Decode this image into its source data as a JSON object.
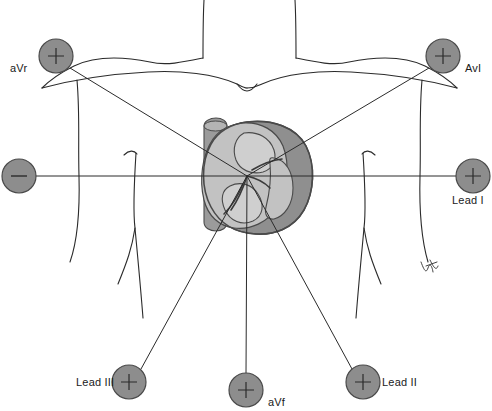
{
  "figure": {
    "background_color": "#ffffff",
    "width": 492,
    "height": 411
  },
  "colors": {
    "electrode_fill": "#8d8d8d",
    "electrode_stroke": "#4a4a4a",
    "axis_line": "#2b2b2b",
    "body_outline": "#2b2b2b",
    "heart_outline": "#4a4a4a",
    "heart_chamber_light": "#c9c9c9",
    "heart_wall_mid": "#a6a6a6",
    "heart_wall_dark": "#8f8f8f",
    "heart_vessel": "#9b9b9b",
    "label_text": "#1a1a1a"
  },
  "heart": {
    "center_x": 247,
    "center_y": 176,
    "description": "cross-sectional heart illustration, grey shaded chambers and walls"
  },
  "electrodes": [
    {
      "id": "avr",
      "label": "aVr",
      "polarity": "+",
      "cx": 56,
      "cy": 56,
      "r": 17,
      "label_x": 10,
      "label_y": 62,
      "label_side": "left"
    },
    {
      "id": "avl",
      "label": "AvI",
      "polarity": "+",
      "cx": 443,
      "cy": 56,
      "r": 17,
      "label_x": 465,
      "label_y": 62,
      "label_side": "right"
    },
    {
      "id": "lead-i-negative",
      "label": "",
      "polarity": "−",
      "cx": 19,
      "cy": 176,
      "r": 17,
      "label_x": 0,
      "label_y": 0,
      "label_side": "none"
    },
    {
      "id": "lead-i",
      "label": "Lead I",
      "polarity": "+",
      "cx": 473,
      "cy": 176,
      "r": 17,
      "label_x": 452,
      "label_y": 194,
      "label_side": "below"
    },
    {
      "id": "lead-iii",
      "label": "Lead III",
      "polarity": "+",
      "cx": 129,
      "cy": 382,
      "r": 17,
      "label_x": 76,
      "label_y": 381,
      "label_side": "left"
    },
    {
      "id": "avf",
      "label": "aVf",
      "polarity": "+",
      "cx": 246,
      "cy": 390,
      "r": 17,
      "label_x": 268,
      "label_y": 396,
      "label_side": "right"
    },
    {
      "id": "lead-ii",
      "label": "Lead II",
      "polarity": "+",
      "cx": 363,
      "cy": 382,
      "r": 17,
      "label_x": 382,
      "label_y": 381,
      "label_side": "right"
    }
  ],
  "axis_lines": [
    {
      "id": "axis-avr",
      "from": "heart-center",
      "to": "avr",
      "x1": 247,
      "y1": 176,
      "x2": 70,
      "y2": 68
    },
    {
      "id": "axis-avl",
      "from": "heart-center",
      "to": "avl",
      "x1": 247,
      "y1": 176,
      "x2": 429,
      "y2": 68
    },
    {
      "id": "axis-lead-i",
      "from": "lead-i-negative",
      "to": "lead-i",
      "x1": 36,
      "y1": 176,
      "x2": 456,
      "y2": 176
    },
    {
      "id": "axis-lead-iii",
      "from": "heart-center",
      "to": "lead-iii",
      "x1": 247,
      "y1": 176,
      "x2": 141,
      "y2": 369
    },
    {
      "id": "axis-avf",
      "from": "heart-center",
      "to": "avf",
      "x1": 247,
      "y1": 176,
      "x2": 246,
      "y2": 373
    },
    {
      "id": "axis-lead-ii",
      "from": "heart-center",
      "to": "lead-ii",
      "x1": 247,
      "y1": 176,
      "x2": 352,
      "y2": 369
    }
  ],
  "artist_mark": {
    "present": true,
    "x": 420,
    "y": 265,
    "description": "small handwritten signature squiggle near right arm"
  }
}
